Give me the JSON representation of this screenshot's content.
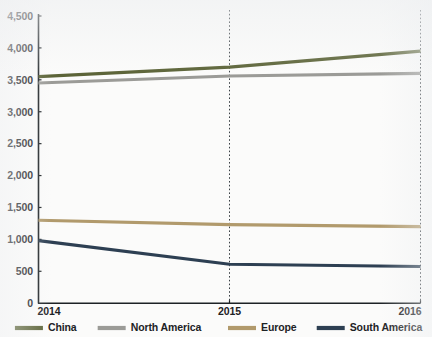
{
  "chart_data": {
    "type": "line",
    "title": "",
    "subtitle": "",
    "xlabel": "",
    "ylabel": "",
    "categories": [
      "2014",
      "2015",
      "2016"
    ],
    "x": [
      2014,
      2015,
      2016
    ],
    "xlim": [
      2014,
      2016
    ],
    "ylim": [
      0,
      4500
    ],
    "ytick_step": 500,
    "grid": "vertical-dotted",
    "legend_position": "bottom",
    "yticks": [
      {
        "value": 4500,
        "label": "4,500"
      },
      {
        "value": 4000,
        "label": "4,000"
      },
      {
        "value": 3500,
        "label": "3,500"
      },
      {
        "value": 3000,
        "label": "3,000"
      },
      {
        "value": 2500,
        "label": "2,500"
      },
      {
        "value": 2000,
        "label": "2,000"
      },
      {
        "value": 1500,
        "label": "1,500"
      },
      {
        "value": 1000,
        "label": "1,000"
      },
      {
        "value": 500,
        "label": "500"
      },
      {
        "value": 0,
        "label": "0"
      }
    ],
    "xticks": [
      {
        "value": 2014,
        "label": "2014"
      },
      {
        "value": 2015,
        "label": "2015"
      },
      {
        "value": 2016,
        "label": "2016"
      }
    ],
    "series": [
      {
        "name": "China",
        "color": "#5c6438",
        "values": [
          3550,
          3700,
          3950
        ]
      },
      {
        "name": "North America",
        "color": "#9b9b97",
        "values": [
          3450,
          3560,
          3600
        ]
      },
      {
        "name": "Europe",
        "color": "#b19a6c",
        "values": [
          1300,
          1230,
          1200
        ]
      },
      {
        "name": "South America",
        "color": "#2d3f52",
        "values": [
          980,
          610,
          575
        ]
      }
    ]
  },
  "legend": {
    "items": [
      {
        "label": "China",
        "color": "#5c6438"
      },
      {
        "label": "North America",
        "color": "#9b9b97"
      },
      {
        "label": "Europe",
        "color": "#b19a6c"
      },
      {
        "label": "South America",
        "color": "#2d3f52"
      }
    ]
  },
  "colors": {
    "axis": "#1d2225",
    "grid": "#3a4045",
    "background": "#fbfbfa",
    "text": "#1d2225"
  }
}
